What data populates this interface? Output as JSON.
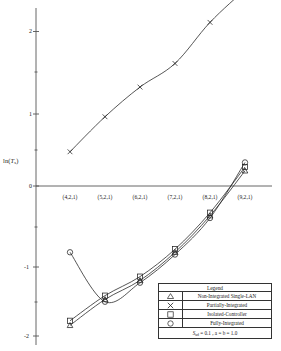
{
  "chart_data": {
    "type": "line",
    "title": "",
    "xlabel": "",
    "ylabel": "ln(Ts)",
    "ylabel_base": "ln(",
    "ylabel_var": "T",
    "ylabel_sub": "s",
    "ylabel_close": ")",
    "categories": [
      "(4,2,1)",
      "(5,2,1)",
      "(6,2,1)",
      "(7,2,1)",
      "(8,2,1)",
      "(9,2,1)"
    ],
    "yticks": [
      "2",
      "1",
      "0",
      "-1",
      "-2"
    ],
    "ytick_values": [
      2,
      1,
      0,
      -1,
      -2
    ],
    "ylim": [
      -2.15,
      2.75
    ],
    "grid": false,
    "axis_zero_line": true,
    "legend_position": "bottom-right",
    "series": [
      {
        "name": "Partially-Integrated",
        "marker": "x",
        "values": [
          0.42,
          0.88,
          1.27,
          1.58,
          2.12,
          2.55
        ]
      },
      {
        "name": "Isolated-Controller",
        "marker": "square",
        "values": [
          -1.8,
          -1.47,
          -1.22,
          -0.86,
          -0.38,
          0.22
        ]
      },
      {
        "name": "Non-Integrated Single-LAN",
        "marker": "triangle",
        "values": [
          -1.86,
          -1.52,
          -1.27,
          -0.9,
          -0.42,
          0.17
        ]
      },
      {
        "name": "Fully-Integrated",
        "marker": "circle",
        "values": [
          -0.9,
          -1.55,
          -1.3,
          -0.93,
          -0.45,
          0.28
        ]
      }
    ],
    "annotations": []
  },
  "legend": {
    "title": "Legend",
    "rows": [
      {
        "symbol": "triangle",
        "label": "Non-Integrated Single-LAN"
      },
      {
        "symbol": "x",
        "label": "Partially-Integrated"
      },
      {
        "symbol": "square",
        "label": "Isolated-Controller"
      },
      {
        "symbol": "circle",
        "label": "Fully-Integrated"
      }
    ],
    "footer": {
      "param1_var": "S",
      "param1_sub": "ad",
      "param1_rest": " = 0.1 ,",
      "param2": "a = b = 1.0"
    }
  },
  "colors": {
    "line": "#2b2b2b",
    "axis": "#4a4a4a",
    "text": "#1a1a1a",
    "background": "#ffffff"
  }
}
